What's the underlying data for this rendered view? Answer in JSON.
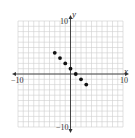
{
  "chart_data": {
    "type": "scatter",
    "title": "",
    "xlabel": "x",
    "ylabel": "y",
    "xlim": [
      -10,
      10
    ],
    "ylim": [
      -10,
      10
    ],
    "grid": true,
    "x_tick_labels": [
      "-10",
      "10"
    ],
    "y_tick_labels": [
      "10",
      "-10"
    ],
    "points": [
      {
        "x": -3,
        "y": 4
      },
      {
        "x": -2,
        "y": 3
      },
      {
        "x": -1,
        "y": 2
      },
      {
        "x": 0,
        "y": 1
      },
      {
        "x": 1,
        "y": 0
      },
      {
        "x": 2,
        "y": -1
      },
      {
        "x": 3,
        "y": -2
      }
    ],
    "colors": {
      "grid": "#cfcfcf",
      "axis": "#333333",
      "point": "#111111"
    }
  },
  "labels": {
    "x_axis": "x",
    "y_axis": "y",
    "x_min": "−10",
    "x_max": "10",
    "y_max": "10",
    "y_min": "−10"
  }
}
